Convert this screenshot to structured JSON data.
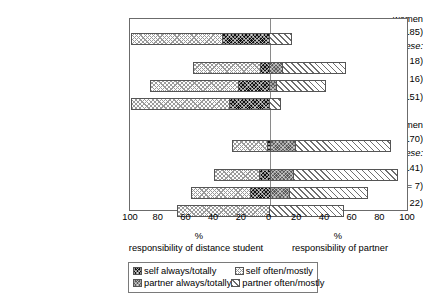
{
  "chart_data": {
    "type": "bar",
    "orientation": "horizontal",
    "layout": "diverging-stacked",
    "title": "",
    "xlabel": "%",
    "ylabel": "",
    "xlim": [
      -100,
      100
    ],
    "grid": false,
    "zero_line": 0,
    "axis": {
      "tick_labels": [
        "100",
        "80",
        "60",
        "40",
        "20",
        "0",
        "20",
        "40",
        "60",
        "80",
        "100"
      ],
      "tick_values": [
        -100,
        -80,
        -60,
        -40,
        -20,
        0,
        20,
        40,
        60,
        80,
        100
      ]
    },
    "side_captions": {
      "left_pct": "%",
      "right_pct": "%",
      "left": "responsibility of distance student",
      "right": "responsibility of partner"
    },
    "legend": {
      "position": "bottom",
      "entries": [
        {
          "key": "self_always",
          "label": "self always/totally",
          "pattern": "black-checkered"
        },
        {
          "key": "self_often",
          "label": "self often/mostly",
          "pattern": "light-dotted"
        },
        {
          "key": "partner_always",
          "label": "partner always/totally",
          "pattern": "dark-gray-checkered"
        },
        {
          "key": "partner_often",
          "label": "partner often/mostly",
          "pattern": "white-diagonal-hatch"
        }
      ]
    },
    "groups": [
      {
        "name": "women",
        "of_these_label": "of these:"
      },
      {
        "name": "men",
        "of_these_label": "of these:"
      }
    ],
    "categories": [
      "all family women (n = 185)",
      "full-time job (n = 18)",
      "part-time job (n = 16)",
      "no paid work (n = 151)",
      "all family men (n = 170)",
      "full-time job (n = 141)",
      "part-time job (n = 7)",
      "no paid work (n = 22)"
    ],
    "series": [
      {
        "name": "self often/mostly",
        "values": [
          66,
          48,
          63,
          71,
          25,
          32,
          43,
          67
        ]
      },
      {
        "name": "self always/totally",
        "values": [
          34,
          7,
          23,
          29,
          2,
          8,
          14,
          0
        ]
      },
      {
        "name": "partner always/totally",
        "values": [
          0,
          9,
          5,
          0,
          18,
          17,
          14,
          0
        ]
      },
      {
        "name": "partner often/mostly",
        "values": [
          16,
          46,
          36,
          8,
          70,
          76,
          57,
          54
        ]
      }
    ],
    "rows": [
      {
        "label": "all family women (n = 185)",
        "self_often": 66,
        "self_always": 34,
        "partner_always": 0,
        "partner_often": 16
      },
      {
        "label": "full-time job (n = 18)",
        "self_often": 48,
        "self_always": 7,
        "partner_always": 9,
        "partner_often": 46
      },
      {
        "label": "part-time job (n = 16)",
        "self_often": 63,
        "self_always": 23,
        "partner_always": 5,
        "partner_often": 36
      },
      {
        "label": "no paid work (n = 151)",
        "self_often": 71,
        "self_always": 29,
        "partner_always": 0,
        "partner_often": 8
      },
      {
        "label": "all family men (n = 170)",
        "self_often": 25,
        "self_always": 2,
        "partner_always": 18,
        "partner_often": 70
      },
      {
        "label": "full-time job (n = 141)",
        "self_often": 32,
        "self_always": 8,
        "partner_always": 17,
        "partner_often": 76
      },
      {
        "label": "part-time job (n = 7)",
        "self_often": 43,
        "self_always": 14,
        "partner_always": 14,
        "partner_often": 57
      },
      {
        "label": "no paid work (n = 22)",
        "self_often": 67,
        "self_always": 0,
        "partner_always": 0,
        "partner_often": 54
      }
    ]
  },
  "labels": {
    "women_group": "women",
    "women_all": "all family women (n = 185)",
    "women_ofthese": "of these:",
    "women_fulltime": "full-time job (n = 18)",
    "women_parttime": "part-time job (n = 16)",
    "women_nopaid": "no paid work (n = 151)",
    "men_group": "men",
    "men_all": "all family men (n = 170)",
    "men_ofthese": "of these:",
    "men_fulltime": "full-time job (n = 141)",
    "men_parttime": "part-time job (n = 7)",
    "men_nopaid": "no paid work (n = 22)"
  },
  "colors": {
    "self_always": "#111111",
    "self_often": "#fdfdfd",
    "partner_always": "#5b5b5b",
    "partner_often": "#ffffff",
    "axis": "#6b6b6b",
    "zero_line": "#8a8a8a"
  }
}
